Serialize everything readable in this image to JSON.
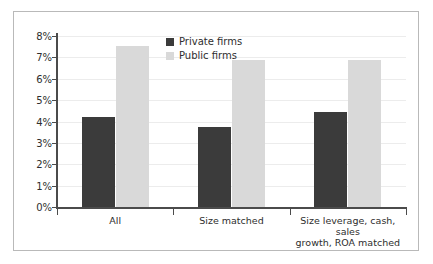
{
  "chart_data": {
    "type": "bar",
    "title": "",
    "subtitle": "",
    "xlabel": "",
    "ylabel": "",
    "ylim": [
      0,
      8
    ],
    "grid": true,
    "legend_position": "top-center",
    "categories": [
      "All",
      "Size matched",
      "Size leverage, cash, sales growth, ROA matched"
    ],
    "category_lines": [
      [
        "All"
      ],
      [
        "Size matched"
      ],
      [
        "Size leverage, cash, sales",
        "growth, ROA matched"
      ]
    ],
    "ytick_labels": [
      "8%",
      "7%",
      "6%",
      "5%",
      "4%",
      "3%",
      "2%",
      "1%",
      "0%"
    ],
    "ytick_values": [
      8,
      7,
      6,
      5,
      4,
      3,
      2,
      1,
      0
    ],
    "series": [
      {
        "name": "Private firms",
        "color": "#3b3b3b",
        "values": [
          4.2,
          3.75,
          4.45
        ]
      },
      {
        "name": "Public firms",
        "color": "#d9d9d9",
        "values": [
          7.55,
          6.9,
          6.9
        ]
      }
    ]
  },
  "legend": {
    "items": [
      {
        "label": "Private firms",
        "color": "#3b3b3b"
      },
      {
        "label": "Public firms",
        "color": "#d9d9d9"
      }
    ]
  },
  "colors": {
    "private": "#3b3b3b",
    "public": "#d9d9d9",
    "axis": "#4b4b4b",
    "grid": "#ececec",
    "frame": "#b9b9b9",
    "text": "#2e2e2e"
  }
}
